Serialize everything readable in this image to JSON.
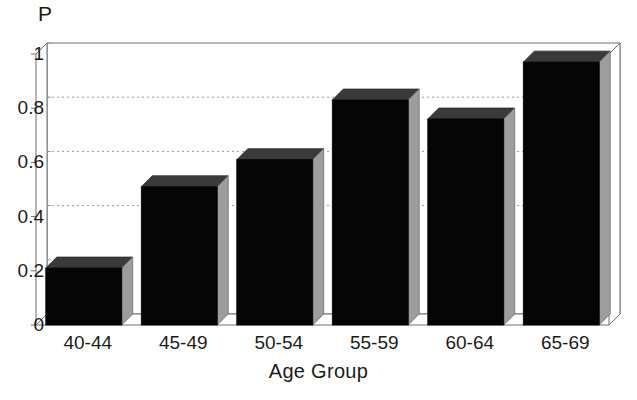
{
  "chart_data": {
    "type": "bar",
    "title": "",
    "ylabel": "P",
    "xlabel": "Age Group",
    "categories": [
      "40-44",
      "45-49",
      "50-54",
      "55-59",
      "60-64",
      "65-69"
    ],
    "values": [
      0.21,
      0.51,
      0.61,
      0.83,
      0.76,
      0.97
    ],
    "ylim": [
      0,
      1
    ],
    "yticks": [
      "0",
      "0.2",
      "0.4",
      "0.6",
      "0.8",
      "1"
    ],
    "ytick_values": [
      0,
      0.2,
      0.4,
      0.6,
      0.8,
      1
    ],
    "gridlines": [
      0.4,
      0.6,
      0.8
    ],
    "grid": true,
    "legend": "none",
    "style": "3d-bars",
    "colors": {
      "bar_front": "#050505",
      "bar_top": "#3a3a3a",
      "bar_side": "#9d9d9d",
      "axis": "#6e6e6e",
      "grid": "#9a9a9a",
      "background": "#ffffff",
      "text": "#1b1b1b"
    }
  }
}
